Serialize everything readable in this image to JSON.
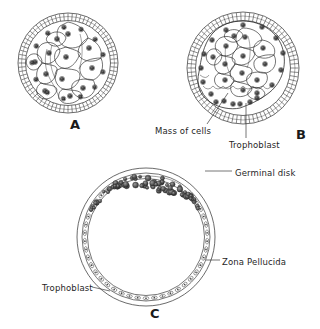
{
  "figure": {
    "background_color": "#ffffff",
    "ink_color": "#1f1f1f",
    "panels": [
      {
        "letter": "A",
        "name": "morula",
        "description": "Morula: solid ball of blastomeres enclosed by a striated zona pellucida"
      },
      {
        "letter": "B",
        "name": "early-blastocyst",
        "description": "Early blastocyst: inner mass of cells, fluid cavity and trophoblast layer inside the zona pellucida"
      },
      {
        "letter": "C",
        "name": "expanded-blastocyst",
        "description": "Expanded blastocyst: thin trophoblast wall, large cavity and a germinal disk of heaped cells"
      }
    ],
    "labels": {
      "mass_of_cells": "Mass of cells",
      "trophoblast_b": "Trophoblast",
      "germinal_disk": "Germinal disk",
      "zona_pellucida": "Zona  Pellucida",
      "trophoblast_c": "Trophoblast"
    }
  },
  "chart_data": {
    "type": "diagram",
    "panels": [
      {
        "id": "A",
        "label": "A",
        "center": [
          68,
          63
        ],
        "outer_radius": 50,
        "zona_outer_radius": 50,
        "zona_inner_radius": 42,
        "zona_striations": 72,
        "inner_cell_count": 11,
        "peripheral_nuclei": 13
      },
      {
        "id": "B",
        "label": "B",
        "center": [
          243,
          68
        ],
        "outer_radius": 56,
        "zona_outer_radius": 56,
        "zona_inner_radius": 47,
        "zona_striations": 78,
        "inner_cell_mass_cells": 14,
        "cavity_present": true,
        "trophoblast_nuclei": 16
      },
      {
        "id": "C",
        "label": "C",
        "center": [
          146,
          237
        ],
        "outer_radius": 70,
        "zona_outer_radius": 70,
        "trophoblast_radius": 64,
        "trophoblast_cells": 46,
        "germinal_disk_cells": 58,
        "germinal_disk_arc_degrees": [
          248,
          310
        ]
      }
    ],
    "annotations": [
      {
        "text": "Mass of cells",
        "panel": "B",
        "x": 155,
        "y": 126,
        "leader": [
          [
            208,
            124
          ],
          [
            228,
            93
          ]
        ]
      },
      {
        "text": "Trophoblast",
        "panel": "B",
        "x": 229,
        "y": 140,
        "leader": [
          [
            246,
            138
          ],
          [
            246,
            104
          ]
        ]
      },
      {
        "text": "Germinal disk",
        "panel": "C",
        "x": 235,
        "y": 168,
        "leader": [
          [
            232,
            172
          ],
          [
            205,
            172
          ]
        ]
      },
      {
        "text": "Zona  Pellucida",
        "panel": "C",
        "x": 222,
        "y": 257,
        "leader": [
          [
            219,
            261
          ],
          [
            207,
            261
          ]
        ]
      },
      {
        "text": "Trophoblast",
        "panel": "C",
        "x": 42,
        "y": 283,
        "leader": [
          [
            91,
            287
          ],
          [
            107,
            290
          ]
        ]
      }
    ]
  }
}
